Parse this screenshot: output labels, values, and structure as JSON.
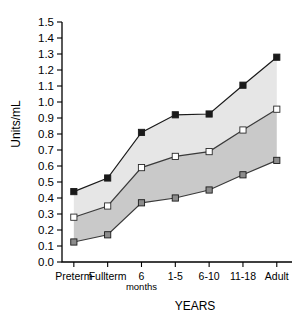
{
  "chart_data": {
    "type": "line",
    "title": "",
    "subtitle": "",
    "xlabel": "YEARS",
    "ylabel": "Units/mL",
    "categories": [
      "Preterm",
      "Fullterm",
      "6",
      "1-5",
      "6-10",
      "11-18",
      "Adult"
    ],
    "category_sublabels": [
      "",
      "",
      "months",
      "",
      "",
      "",
      ""
    ],
    "x": [
      0,
      1,
      2,
      3,
      4,
      5,
      6
    ],
    "ylim": [
      0.0,
      1.5
    ],
    "xlim": [
      -0.35,
      6.45
    ],
    "ytick_step": 0.1,
    "ytick_labels": [
      "0.0",
      "0.1",
      "0.2",
      "0.3",
      "0.4",
      "0.5",
      "0.6",
      "0.7",
      "0.8",
      "0.9",
      "1.0",
      "1.1",
      "1.2",
      "1.3",
      "1.4",
      "1.5"
    ],
    "ytick_values": [
      0.0,
      0.1,
      0.2,
      0.3,
      0.4,
      0.5,
      0.6,
      0.7,
      0.8,
      0.9,
      1.0,
      1.1,
      1.2,
      1.3,
      1.4,
      1.5
    ],
    "grid": false,
    "legend": "none",
    "series": [
      {
        "name": "Upper limit",
        "marker": "filled-square",
        "marker_color": "#1a1a1a",
        "line_color": "#1a1a1a",
        "values": [
          0.44,
          0.525,
          0.81,
          0.92,
          0.925,
          1.105,
          1.28
        ]
      },
      {
        "name": "Mean",
        "marker": "open-square",
        "marker_color": "#ffffff",
        "line_color": "#3a3a3a",
        "values": [
          0.28,
          0.35,
          0.59,
          0.66,
          0.69,
          0.825,
          0.955
        ]
      },
      {
        "name": "Lower limit",
        "marker": "gray-square",
        "marker_color": "#8c8c8c",
        "line_color": "#3a3a3a",
        "values": [
          0.125,
          0.17,
          0.37,
          0.4,
          0.45,
          0.545,
          0.635
        ]
      }
    ],
    "bands": [
      {
        "name": "upper-band",
        "between": [
          "Upper limit",
          "Mean"
        ],
        "fill": "#e6e6e6"
      },
      {
        "name": "lower-band",
        "between": [
          "Mean",
          "Lower limit"
        ],
        "fill": "#c9c9c9"
      }
    ],
    "colors": {
      "upper_band_fill": "#e6e6e6",
      "lower_band_fill": "#c9c9c9",
      "axis": "#000000",
      "background": "#ffffff"
    }
  }
}
